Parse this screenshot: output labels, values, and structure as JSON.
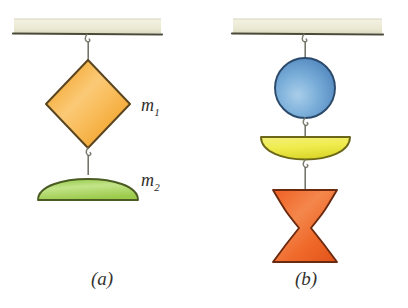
{
  "figure": {
    "background_color": "#ffffff",
    "panels": [
      {
        "id": "a",
        "caption": "(a)",
        "ceiling": {
          "name": "ceiling-support",
          "fill_color": "#efeedb",
          "edge_color": "#4a4a38"
        },
        "objects": [
          {
            "id": "m1",
            "label": "m",
            "subscript": "1",
            "shape": "diamond",
            "fill_color": "#f5a623",
            "highlight_color": "#fbd08a",
            "outline_color": "#5b4520"
          },
          {
            "id": "m2",
            "label": "m",
            "subscript": "2",
            "shape": "dome-up",
            "fill_color": "#a8d25a",
            "highlight_color": "#d6ea9e",
            "outline_color": "#4a5c24"
          }
        ]
      },
      {
        "id": "b",
        "caption": "(b)",
        "ceiling": {
          "name": "ceiling-support",
          "fill_color": "#efeedb",
          "edge_color": "#4a4a38"
        },
        "objects": [
          {
            "id": "m3",
            "label": "m",
            "subscript": "3",
            "shape": "sphere",
            "fill_color": "#5b96cf",
            "highlight_color": "#a8cbe8",
            "outline_color": "#2b4a6b"
          },
          {
            "id": "m4",
            "label": "",
            "subscript": "",
            "shape": "dome-down",
            "fill_color": "#eeea4a",
            "highlight_color": "#f7f5a8",
            "outline_color": "#6b6618"
          },
          {
            "id": "m5",
            "label": "m",
            "subscript": "5",
            "shape": "hourglass",
            "fill_color": "#ef6a2b",
            "highlight_color": "#f79b63",
            "outline_color": "#6b2a10"
          }
        ]
      }
    ],
    "connector": {
      "name": "hook-and-wire",
      "wire_color": "#6d6d63",
      "hook_color": "#8a8a7e"
    }
  }
}
